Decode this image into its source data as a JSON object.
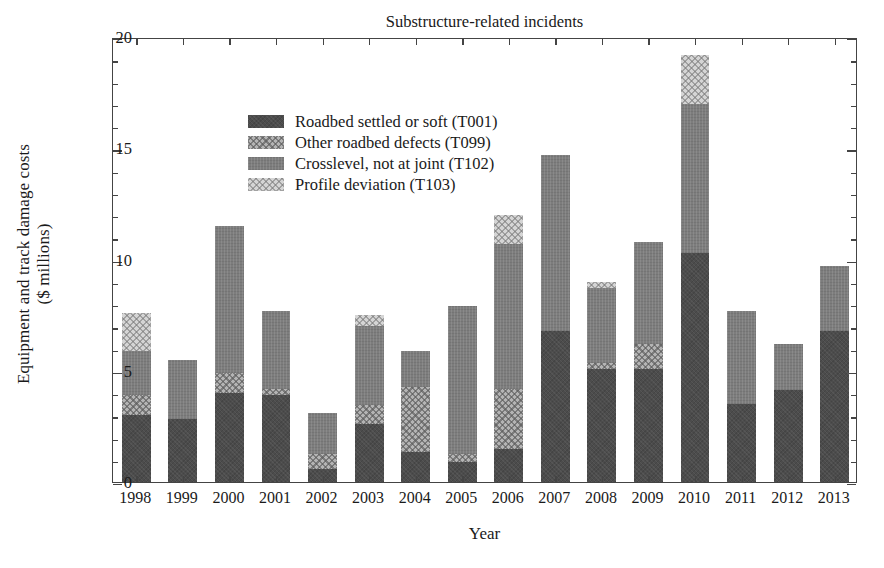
{
  "chart_data": {
    "type": "bar",
    "subtype": "stacked-bar",
    "title": "Substructure-related incidents",
    "xlabel": "Year",
    "ylabel": "Equipment and track damage costs\n($ millions)",
    "ylabel_line1": "Equipment and track damage costs",
    "ylabel_line2": "($ millions)",
    "categories": [
      "1998",
      "1999",
      "2000",
      "2001",
      "2002",
      "2003",
      "2004",
      "2005",
      "2006",
      "2007",
      "2008",
      "2009",
      "2010",
      "2011",
      "2012",
      "2013"
    ],
    "ylim": [
      0,
      20
    ],
    "yticks": [
      0,
      5,
      10,
      15,
      20
    ],
    "ytick_labels": [
      "0",
      "5",
      "10",
      "15",
      "20"
    ],
    "y_minor_tick_step": 1,
    "grid": false,
    "legend_position": "upper left",
    "series": [
      {
        "name": "Roadbed settled or soft (T001)",
        "code": "T001",
        "color": "#4c4c4c",
        "pattern": "solid-dark",
        "values": [
          3.0,
          2.85,
          4.0,
          3.9,
          0.6,
          2.6,
          1.35,
          0.9,
          1.5,
          6.8,
          5.1,
          5.1,
          10.3,
          3.5,
          4.15,
          6.8
        ]
      },
      {
        "name": "Other roadbed defects (T099)",
        "code": "T099",
        "color": "#b4b4b4",
        "pattern": "cross-hatch-light",
        "values": [
          0.9,
          0.0,
          0.9,
          0.3,
          0.65,
          0.85,
          2.9,
          0.35,
          2.7,
          0.0,
          0.25,
          1.1,
          0.0,
          0.0,
          0.0,
          0.0
        ]
      },
      {
        "name": "Crosslevel, not at joint (T102)",
        "code": "T102",
        "color": "#7d7d7d",
        "pattern": "solid-medium",
        "values": [
          2.0,
          2.65,
          6.6,
          3.5,
          1.85,
          3.55,
          1.65,
          6.65,
          6.5,
          7.9,
          3.35,
          4.6,
          6.7,
          4.2,
          2.05,
          2.9
        ]
      },
      {
        "name": "Profile deviation (T103)",
        "code": "T103",
        "color": "#d5d5d5",
        "pattern": "cross-hatch-lighter",
        "values": [
          1.7,
          0.0,
          0.0,
          0.0,
          0.0,
          0.5,
          0.0,
          0.0,
          1.3,
          0.0,
          0.3,
          0.0,
          2.2,
          0.0,
          0.0,
          0.0
        ]
      }
    ],
    "totals": [
      7.6,
      5.5,
      11.5,
      7.7,
      3.1,
      7.5,
      5.9,
      7.9,
      12.0,
      14.7,
      9.0,
      10.8,
      19.2,
      7.7,
      6.2,
      9.7
    ]
  },
  "legend": {
    "items": [
      {
        "label": "Roadbed settled or soft (T001)"
      },
      {
        "label": "Other roadbed defects (T099)"
      },
      {
        "label": "Crosslevel, not at joint (T102)"
      },
      {
        "label": "Profile deviation (T103)"
      }
    ]
  }
}
